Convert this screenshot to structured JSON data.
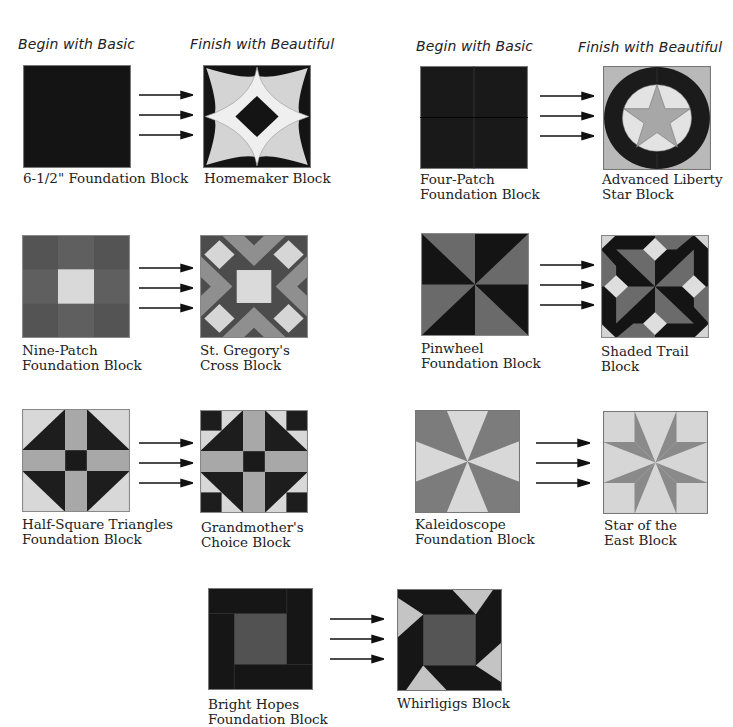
{
  "headers": {
    "left_basic": "Begin with Basic",
    "left_beautiful": "Finish with Beautiful",
    "right_basic": "Begin with Basic",
    "right_beautiful": "Finish with Beautiful"
  },
  "colors": {
    "black": "#141414",
    "dark_gray": "#4a4a4a",
    "medium_gray": "#7d7d7d",
    "light_gray": "#b4b4b4",
    "pale_gray": "#d6d6d6",
    "border": "#777777"
  },
  "pairs": [
    {
      "basic": {
        "name": "6-1/2\" Foundation Block",
        "lines": [
          "6-1/2\" Foundation Block"
        ],
        "icon": "solid-square-block"
      },
      "beautiful": {
        "name": "Homemaker Block",
        "lines": [
          "Homemaker Block"
        ],
        "icon": "homemaker-block"
      }
    },
    {
      "basic": {
        "name": "Four-Patch Foundation Block",
        "lines": [
          "Four-Patch",
          "Foundation Block"
        ],
        "icon": "four-patch-block"
      },
      "beautiful": {
        "name": "Advanced Liberty Star Block",
        "lines": [
          "Advanced Liberty",
          "Star Block"
        ],
        "icon": "liberty-star-block"
      }
    },
    {
      "basic": {
        "name": "Nine-Patch Foundation Block",
        "lines": [
          "Nine-Patch",
          "Foundation Block"
        ],
        "icon": "nine-patch-block"
      },
      "beautiful": {
        "name": "St. Gregory's Cross Block",
        "lines": [
          "St. Gregory's",
          "Cross Block"
        ],
        "icon": "st-gregorys-cross-block"
      }
    },
    {
      "basic": {
        "name": "Pinwheel Foundation Block",
        "lines": [
          "Pinwheel",
          "Foundation Block"
        ],
        "icon": "pinwheel-block"
      },
      "beautiful": {
        "name": "Shaded Trail Block",
        "lines": [
          "Shaded Trail",
          "Block"
        ],
        "icon": "shaded-trail-block"
      }
    },
    {
      "basic": {
        "name": "Half-Square Triangles Foundation Block",
        "lines": [
          "Half-Square Triangles",
          "Foundation Block"
        ],
        "icon": "half-square-triangles-block"
      },
      "beautiful": {
        "name": "Grandmother's Choice Block",
        "lines": [
          "Grandmother's",
          "Choice Block"
        ],
        "icon": "grandmothers-choice-block"
      }
    },
    {
      "basic": {
        "name": "Kaleidoscope Foundation Block",
        "lines": [
          "Kaleidoscope",
          "Foundation Block"
        ],
        "icon": "kaleidoscope-block"
      },
      "beautiful": {
        "name": "Star of the East Block",
        "lines": [
          "Star of the",
          "East Block"
        ],
        "icon": "star-of-the-east-block"
      }
    },
    {
      "basic": {
        "name": "Bright Hopes Foundation Block",
        "lines": [
          "Bright Hopes",
          "Foundation Block"
        ],
        "icon": "bright-hopes-block"
      },
      "beautiful": {
        "name": "Whirligigs Block",
        "lines": [
          "Whirligigs Block"
        ],
        "icon": "whirligigs-block"
      }
    }
  ],
  "arrow_icon": "right-arrow-icon",
  "arrows_per_pair": 3
}
